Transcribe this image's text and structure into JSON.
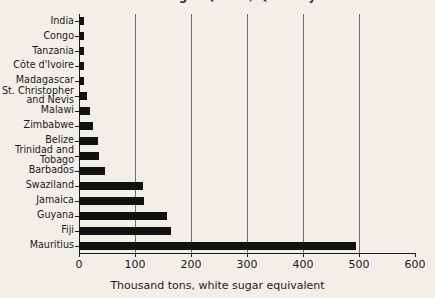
{
  "chart_data": {
    "type": "bar",
    "orientation": "horizontal",
    "title": "World Sugar Quota / Quantity",
    "title_clipped": true,
    "xlabel": "Thousand tons, white sugar equivalent",
    "ylabel": "",
    "xlim": [
      0,
      600
    ],
    "xticks": [
      0,
      100,
      200,
      300,
      400,
      500,
      600
    ],
    "xtick_labels": [
      "0",
      "100",
      "200",
      "300",
      "400",
      "500",
      "600"
    ],
    "grid": "vertical",
    "gridlines": [
      100,
      200,
      300,
      400,
      500
    ],
    "legend": "none",
    "categories": [
      "India",
      "Congo",
      "Tanzania",
      "Côte d'Ivoire",
      "Madagascar",
      "St. Christopher\nand Nevis",
      "Malawi",
      "Zimbabwe",
      "Belize",
      "Trinidad and\nTobago",
      "Barbados",
      "Swaziland",
      "Jamaica",
      "Guyana",
      "Fiji",
      "Mauritius"
    ],
    "values": [
      9,
      9,
      9,
      9,
      9,
      14,
      20,
      25,
      34,
      36,
      46,
      115,
      116,
      158,
      165,
      495
    ],
    "bar_color": "#111111",
    "background_color": "#f2efe9",
    "gridline_color": "#6e6e6e",
    "axis_color": "#1a1a1a"
  }
}
